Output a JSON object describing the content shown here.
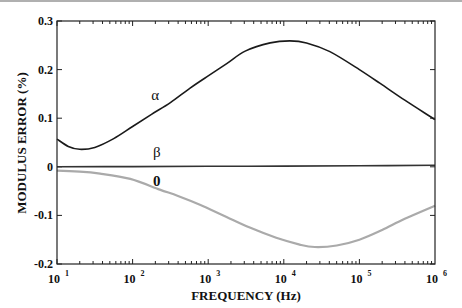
{
  "chart_data": {
    "type": "line",
    "title": "",
    "xlabel": "FREQUENCY (Hz)",
    "ylabel": "MODULUS ERROR (%)",
    "xscale": "log",
    "xlim": [
      10,
      1000000
    ],
    "ylim": [
      -0.2,
      0.3
    ],
    "x_ticks": [
      {
        "base": "10",
        "exp": "1",
        "value": 1
      },
      {
        "base": "10",
        "exp": "2",
        "value": 2
      },
      {
        "base": "10",
        "exp": "3",
        "value": 3
      },
      {
        "base": "10",
        "exp": "4",
        "value": 4
      },
      {
        "base": "10",
        "exp": "5",
        "value": 5
      },
      {
        "base": "10",
        "exp": "6",
        "value": 6
      }
    ],
    "y_ticks": [
      {
        "label": "0.3",
        "value": 0.3
      },
      {
        "label": "0.2",
        "value": 0.2
      },
      {
        "label": "0.1",
        "value": 0.1
      },
      {
        "label": "0",
        "value": 0
      },
      {
        "label": "-0.1",
        "value": -0.1
      },
      {
        "label": "-0.2",
        "value": -0.2
      }
    ],
    "grid": false,
    "legend": "inline labels on curves",
    "series": [
      {
        "name": "α",
        "color": "#1a1a1a",
        "log10_x": [
          1.0,
          1.15,
          1.3,
          1.5,
          1.75,
          2.0,
          2.25,
          2.5,
          2.76,
          3.0,
          3.25,
          3.49,
          3.82,
          4.08,
          4.3,
          4.61,
          5.0,
          5.27,
          5.6,
          6.0
        ],
        "values": [
          0.057,
          0.042,
          0.036,
          0.04,
          0.058,
          0.083,
          0.108,
          0.132,
          0.162,
          0.187,
          0.213,
          0.238,
          0.255,
          0.259,
          0.255,
          0.237,
          0.2,
          0.172,
          0.137,
          0.097
        ],
        "label_pos": {
          "log10_x": 2.3,
          "value": 0.147
        }
      },
      {
        "name": "β",
        "color": "#333333",
        "log10_x": [
          1.0,
          2.0,
          3.0,
          4.0,
          5.0,
          6.0
        ],
        "values": [
          0.0,
          0.0005,
          0.001,
          0.0015,
          0.002,
          0.003
        ],
        "label_pos": {
          "log10_x": 2.32,
          "value": 0.031
        }
      },
      {
        "name": "0",
        "color": "#aaaaaa",
        "log10_x": [
          1.0,
          1.3,
          1.57,
          1.97,
          2.36,
          2.6,
          2.89,
          3.2,
          3.55,
          3.9,
          4.21,
          4.41,
          4.7,
          5.0,
          5.3,
          5.6,
          6.0
        ],
        "values": [
          -0.008,
          -0.01,
          -0.014,
          -0.025,
          -0.047,
          -0.06,
          -0.078,
          -0.1,
          -0.125,
          -0.146,
          -0.16,
          -0.165,
          -0.162,
          -0.15,
          -0.13,
          -0.107,
          -0.08
        ],
        "label_pos": {
          "log10_x": 2.32,
          "value": -0.03
        }
      }
    ]
  }
}
